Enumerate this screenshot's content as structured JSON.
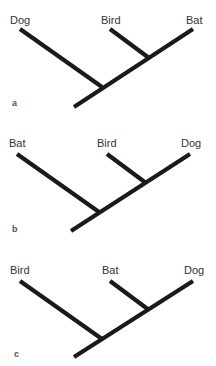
{
  "figure": {
    "line_color": "#1a1a1a",
    "text_color": "#333333",
    "panels": [
      {
        "letter": "a",
        "letter_pos": [
          12,
          106
        ],
        "taxa": [
          {
            "name": "Dog",
            "x": 10,
            "y": 24
          },
          {
            "name": "Bird",
            "x": 101,
            "y": 24
          },
          {
            "name": "Bat",
            "x": 186,
            "y": 24
          }
        ],
        "branches": [
          {
            "role": "trunk-to-right-tip",
            "x1": 74,
            "y1": 107,
            "x2": 193,
            "y2": 29
          },
          {
            "role": "left-tip",
            "x1": 20,
            "y1": 29,
            "x2": 102,
            "y2": 87
          },
          {
            "role": "middle-tip",
            "x1": 110,
            "y1": 29,
            "x2": 149,
            "y2": 58
          }
        ]
      },
      {
        "letter": "b",
        "letter_pos": [
          12,
          232
        ],
        "taxa": [
          {
            "name": "Bat",
            "x": 9,
            "y": 147
          },
          {
            "name": "Bird",
            "x": 97,
            "y": 147
          },
          {
            "name": "Dog",
            "x": 181,
            "y": 147
          }
        ],
        "branches": [
          {
            "role": "trunk-to-right-tip",
            "x1": 71,
            "y1": 231,
            "x2": 190,
            "y2": 154
          },
          {
            "role": "left-tip",
            "x1": 17,
            "y1": 154,
            "x2": 99,
            "y2": 212
          },
          {
            "role": "middle-tip",
            "x1": 107,
            "y1": 154,
            "x2": 146,
            "y2": 183
          }
        ]
      },
      {
        "letter": "c",
        "letter_pos": [
          14,
          357
        ],
        "taxa": [
          {
            "name": "Bird",
            "x": 10,
            "y": 274
          },
          {
            "name": "Bat",
            "x": 102,
            "y": 274
          },
          {
            "name": "Dog",
            "x": 184,
            "y": 274
          }
        ],
        "branches": [
          {
            "role": "trunk-to-right-tip",
            "x1": 74,
            "y1": 357,
            "x2": 193,
            "y2": 281
          },
          {
            "role": "left-tip",
            "x1": 20,
            "y1": 281,
            "x2": 102,
            "y2": 339
          },
          {
            "role": "middle-tip",
            "x1": 110,
            "y1": 281,
            "x2": 149,
            "y2": 310
          }
        ]
      }
    ]
  }
}
